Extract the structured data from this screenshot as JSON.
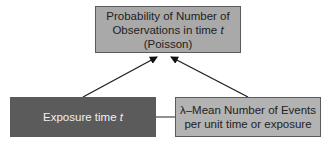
{
  "diagram": {
    "nodes": {
      "outcome": {
        "line1": "Probability of Number of",
        "line2_prefix": "Observations in time ",
        "line2_var": "t",
        "line3": "(Poisson)",
        "fill": "#a9a9a9"
      },
      "exposure": {
        "label_prefix": "Exposure time ",
        "label_var": "t",
        "fill": "#5b5b5b",
        "text_color": "#f0f0f0"
      },
      "rate": {
        "line1": "λ–Mean Number of Events",
        "line2": "per unit time or exposure",
        "fill": "#b3b3b3"
      }
    },
    "edges": [
      {
        "from": "exposure",
        "to": "outcome",
        "type": "arrow"
      },
      {
        "from": "rate",
        "to": "outcome",
        "type": "arrow"
      },
      {
        "from": "exposure",
        "to": "rate",
        "type": "line"
      }
    ]
  }
}
